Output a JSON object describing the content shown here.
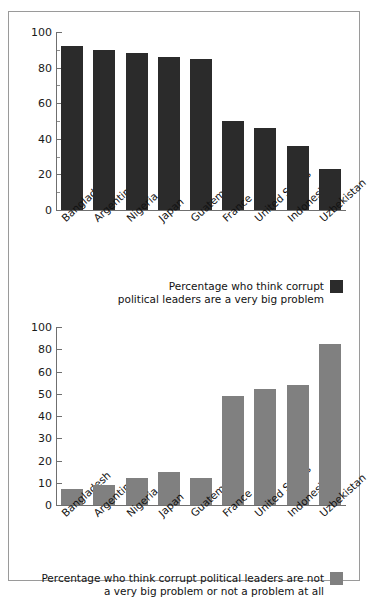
{
  "figure": {
    "border_color": "#9a9a9a",
    "background": "#ffffff"
  },
  "chart_data": [
    {
      "type": "bar",
      "id": "very-big-problem",
      "title": "",
      "xlabel": "",
      "ylabel": "",
      "categories": [
        "Bangladesh",
        "Argentina",
        "Nigeria",
        "Japan",
        "Guatemala",
        "France",
        "United States",
        "Indonesia",
        "Uzbekistan"
      ],
      "values": [
        92,
        90,
        88,
        86,
        85,
        50,
        46,
        36,
        23
      ],
      "ytick_labels": [
        "100",
        "80",
        "60",
        "40",
        "20",
        "0"
      ],
      "ytick_values": [
        100,
        80,
        60,
        40,
        20,
        0
      ],
      "ylim": [
        0,
        100
      ],
      "grid": false,
      "bar_color": "#2b2b2b",
      "legend_position": "bottom-right",
      "legend": [
        {
          "label": "Percentage who think corrupt political leaders are a very big problem",
          "line1": "Percentage who think corrupt",
          "line2": "political leaders are a very big problem",
          "color": "#2b2b2b"
        }
      ]
    },
    {
      "type": "bar",
      "id": "not-a-very-big-problem",
      "title": "",
      "xlabel": "",
      "ylabel": "",
      "categories": [
        "Bangladesh",
        "Argentina",
        "Nigeria",
        "Japan",
        "Guatemala",
        "France",
        "United States",
        "Indonesia",
        "Uzbekistan"
      ],
      "values": [
        7,
        9,
        12,
        15,
        12,
        49,
        52,
        54,
        85
      ],
      "ytick_labels": [
        "100",
        "80",
        "60",
        "50",
        "40",
        "30",
        "20",
        "10",
        "0"
      ],
      "ytick_values": [
        100,
        80,
        60,
        50,
        40,
        30,
        20,
        10,
        0
      ],
      "ylim": [
        0,
        100
      ],
      "grid": false,
      "bar_color": "#808080",
      "legend_position": "bottom-right",
      "legend": [
        {
          "label": "Percentage who think corrupt political leaders are not a very big problem or not a problem at all",
          "line1": "Percentage who think corrupt political leaders are not",
          "line2": "a very big problem or not a problem at all",
          "color": "#808080"
        }
      ]
    }
  ]
}
